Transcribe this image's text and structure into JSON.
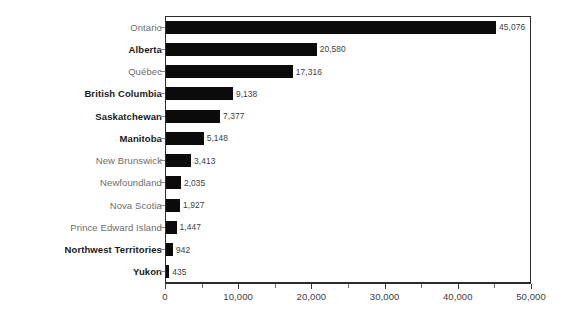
{
  "chart_data": {
    "type": "bar",
    "orientation": "horizontal",
    "title": "",
    "subtitle": "",
    "xlabel": "",
    "ylabel": "",
    "xlim": [
      0,
      50000
    ],
    "grid": false,
    "legend": null,
    "axis": {
      "tick_labels": [
        "0",
        "10,000",
        "20,000",
        "30,000",
        "40,000",
        "50,000"
      ],
      "tick_values": [
        0,
        10000,
        20000,
        30000,
        40000,
        50000
      ],
      "minor_tick_values": [
        5000,
        15000,
        25000,
        35000,
        45000
      ]
    },
    "categories": [
      "Ontario",
      "Alberta",
      "Québec",
      "British Columbia",
      "Saskatchewan",
      "Manitoba",
      "New Brunswick",
      "Newfoundland",
      "Nova Scotia",
      "Prince Edward Island",
      "Northwest Territories",
      "Yukon"
    ],
    "values": [
      45076,
      20580,
      17316,
      9138,
      7377,
      5148,
      3413,
      2035,
      1927,
      1447,
      942,
      435
    ],
    "value_labels": [
      "45,076",
      "20,580",
      "17,316",
      "9,138",
      "7,377",
      "5,148",
      "3,413",
      "2,035",
      "1,927",
      "1,447",
      "942",
      "435"
    ],
    "emphasis": [
      false,
      true,
      false,
      true,
      true,
      true,
      false,
      false,
      false,
      false,
      true,
      true
    ],
    "colors": {
      "bar": "#0b0b0b",
      "label_plain": "#6d6d6d",
      "label_bold": "#1a1a1a",
      "value_label": "#3d3d3d",
      "axis": "#2b2b2b",
      "background": "#ffffff"
    }
  }
}
